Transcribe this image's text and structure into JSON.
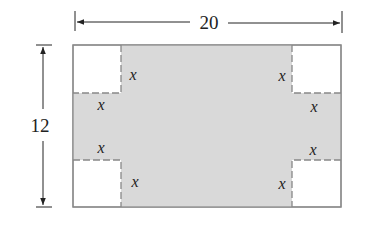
{
  "diagram": {
    "width_label": "20",
    "height_label": "12",
    "cut_label": "x",
    "colors": {
      "shaded": "#d9d9d9",
      "outline": "#888888",
      "dim_line": "#222222",
      "background": "#ffffff"
    },
    "corner_labels": {
      "top_left_side": "x",
      "top_left_bottom": "x",
      "top_right_side": "x",
      "top_right_bottom": "x",
      "bottom_left_top": "x",
      "bottom_left_side": "x",
      "bottom_right_top": "x",
      "bottom_right_side": "x"
    }
  }
}
